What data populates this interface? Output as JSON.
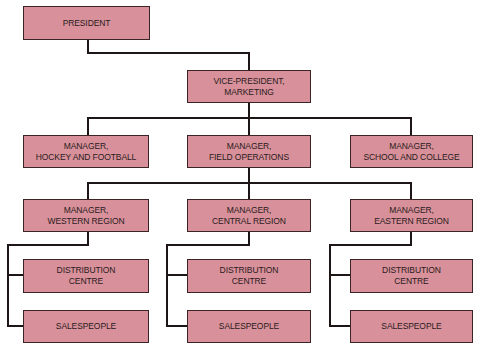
{
  "colors": {
    "box_fill": "#d8919a",
    "box_border": "#3a2426",
    "text": "#2a1a1c",
    "connector": "#1e1616"
  },
  "nodes": {
    "president": {
      "label": "PRESIDENT"
    },
    "vp_marketing": {
      "label": "VICE-PRESIDENT,\nMARKETING"
    },
    "mgr_hockey_football": {
      "label": "MANAGER,\nHOCKEY AND FOOTBALL"
    },
    "mgr_field_operations": {
      "label": "MANAGER,\nFIELD OPERATIONS"
    },
    "mgr_school_college": {
      "label": "MANAGER,\nSCHOOL AND COLLEGE"
    },
    "mgr_western": {
      "label": "MANAGER,\nWESTERN REGION"
    },
    "mgr_central": {
      "label": "MANAGER,\nCENTRAL REGION"
    },
    "mgr_eastern": {
      "label": "MANAGER,\nEASTERN REGION"
    },
    "dist_western": {
      "label": "DISTRIBUTION\nCENTRE"
    },
    "dist_central": {
      "label": "DISTRIBUTION\nCENTRE"
    },
    "dist_eastern": {
      "label": "DISTRIBUTION\nCENTRE"
    },
    "sales_western": {
      "label": "SALESPEOPLE"
    },
    "sales_central": {
      "label": "SALESPEOPLE"
    },
    "sales_eastern": {
      "label": "SALESPEOPLE"
    }
  },
  "hierarchy": {
    "president": [
      "vp_marketing"
    ],
    "vp_marketing": [
      "mgr_hockey_football",
      "mgr_field_operations",
      "mgr_school_college"
    ],
    "mgr_field_operations": [
      "mgr_western",
      "mgr_central",
      "mgr_eastern"
    ],
    "mgr_western": [
      "dist_western",
      "sales_western"
    ],
    "mgr_central": [
      "dist_central",
      "sales_central"
    ],
    "mgr_eastern": [
      "dist_eastern",
      "sales_eastern"
    ]
  }
}
